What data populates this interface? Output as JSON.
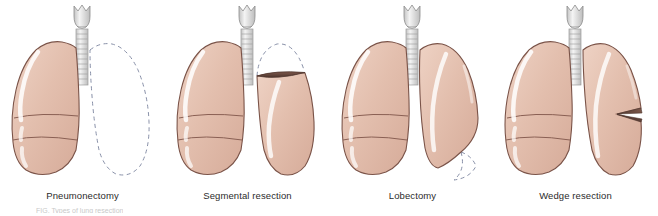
{
  "figure": {
    "background_color": "#ffffff",
    "caption_partial": "FIG. Types of lung resection"
  },
  "style": {
    "lung_fill": "#e3bfae",
    "lung_fill_light": "#eed2c4",
    "lung_fill_deep": "#d6ab99",
    "lung_outline": "#7a5348",
    "fissure_line": "#8a6054",
    "highlight": "#ffffff",
    "cut_surface": "#6b4a3f",
    "cut_surface_dark": "#4e352d",
    "dashed_line": "#8890a8",
    "trachea_fill": "#dcdcdc",
    "trachea_light": "#f2f2f2",
    "trachea_outline": "#8c8c8c",
    "label_color": "#2b2b2b"
  },
  "panels": [
    {
      "id": "pneumonectomy",
      "label": "Pneumonectomy",
      "left_lung": "intact",
      "right_lung": "entirely-removed",
      "dashed_outline": "full-right-lung",
      "cut_surface": "none"
    },
    {
      "id": "segmental-resection",
      "label": "Segmental resection",
      "left_lung": "intact",
      "right_lung": "apical-segment-removed",
      "dashed_outline": "apex-of-right-lung",
      "cut_surface": "horizontal-ellipse-at-apex"
    },
    {
      "id": "lobectomy",
      "label": "Lobectomy",
      "left_lung": "intact",
      "right_lung": "lower-lobe-removed",
      "dashed_outline": "lower-lobe-of-right-lung",
      "cut_surface": "none"
    },
    {
      "id": "wedge-resection",
      "label": "Wedge resection",
      "left_lung": "intact",
      "right_lung": "small-wedge-removed",
      "dashed_outline": "none",
      "cut_surface": "thin-wedge-notch-lateral"
    }
  ],
  "anatomy": {
    "larynx": "thyroid-cartilage",
    "trachea_rings": 10,
    "left_lung_lobes": 3,
    "right_lung_lobes": 2
  }
}
